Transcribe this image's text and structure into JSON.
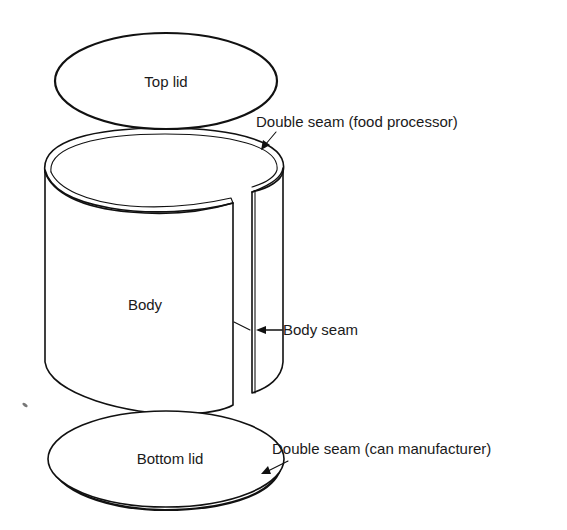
{
  "figure": {
    "parts": {
      "top_lid": "Top lid",
      "body": "Body",
      "bottom_lid": "Bottom lid"
    },
    "callouts": {
      "top_seam": "Double seam (food processor)",
      "body_seam": "Body seam",
      "bottom_seam": "Double seam (can manufacturer)"
    }
  },
  "colors": {
    "line": "#111111",
    "background": "#ffffff",
    "text": "#1a1a1a"
  }
}
